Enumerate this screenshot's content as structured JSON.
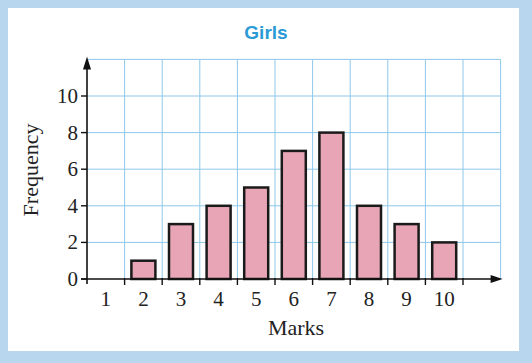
{
  "chart_data": {
    "type": "bar",
    "title": "Girls",
    "xlabel": "Marks",
    "ylabel": "Frequency",
    "categories": [
      "1",
      "2",
      "3",
      "4",
      "5",
      "6",
      "7",
      "8",
      "9",
      "10"
    ],
    "values": [
      0,
      1,
      3,
      4,
      5,
      7,
      8,
      4,
      3,
      2
    ],
    "yticks": [
      "0",
      "2",
      "4",
      "6",
      "8",
      "10"
    ],
    "ylim": [
      0,
      12
    ],
    "grid": true,
    "legend": null,
    "colors": {
      "bar_fill": "#e8a5b6",
      "bar_stroke": "#1a1a1a",
      "grid": "#8ec8ea",
      "title": "#2a9ad6",
      "frame": "#b9d6ef"
    }
  }
}
